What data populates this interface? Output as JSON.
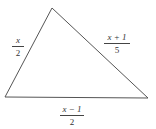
{
  "diagram": {
    "type": "triangle",
    "sides": [
      {
        "name": "left",
        "numerator": "x",
        "denominator": "2"
      },
      {
        "name": "right",
        "numerator": "x + 1",
        "denominator": "5"
      },
      {
        "name": "bottom",
        "numerator": "x − 1",
        "denominator": "2"
      }
    ],
    "stroke_color": "#555555"
  }
}
